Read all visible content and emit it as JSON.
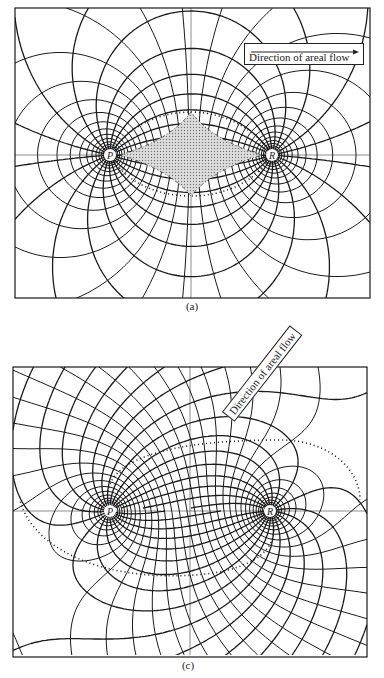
{
  "panels": [
    {
      "id": "a",
      "caption": "(a)",
      "legend": "Direction of areal flow",
      "well_labels": [
        "P",
        "R"
      ],
      "shaded_region": "stagnation diamond between P and R"
    },
    {
      "id": "c",
      "caption": "(c)",
      "legend": "Direction of areal flow",
      "well_labels": [
        "P",
        "R"
      ]
    }
  ],
  "colors": {
    "ink": "#1a1a1a",
    "shade": "#bdbdbd",
    "background": "#ffffff"
  }
}
